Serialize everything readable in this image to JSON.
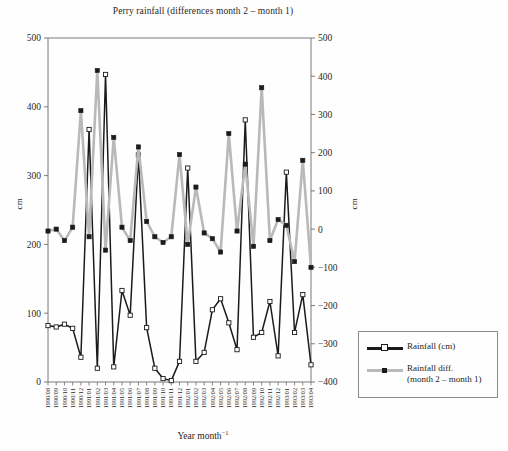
{
  "chart_data": {
    "type": "line",
    "title": "Perry rainfall (differences month 2 – month 1)",
    "xlabel_text": "Year month",
    "xlabel_sup": "−1",
    "ylabel_left": "cm",
    "ylabel_right": "cm",
    "grid": false,
    "legend_position": "right-outside",
    "ylim_left": [
      0,
      500
    ],
    "yticks_left": [
      0,
      100,
      200,
      300,
      400,
      500
    ],
    "ylim_right": [
      -400,
      500
    ],
    "yticks_right": [
      -400,
      -300,
      -200,
      -100,
      0,
      100,
      200,
      300,
      400,
      500
    ],
    "categories": [
      "1990/08",
      "1990/09",
      "1990/10",
      "1990/11",
      "1990/12",
      "1991/01",
      "1991/02",
      "1991/03",
      "1991/04",
      "1991/05",
      "1991/06",
      "1991/07",
      "1991/08",
      "1991/09",
      "1991/10",
      "1991/11",
      "1991/12",
      "1992/01",
      "1992/02",
      "1992/03",
      "1992/04",
      "1992/05",
      "1992/06",
      "1992/07",
      "1992/08",
      "1992/09",
      "1992/10",
      "1992/11",
      "1992/12",
      "1993/01",
      "1993/02",
      "1993/03",
      "1993/04"
    ],
    "series": [
      {
        "name": "Rainfall (cm)",
        "axis": "left",
        "color": "#1b1b1b",
        "marker": "open-square",
        "values": [
          82,
          80,
          84,
          78,
          36,
          367,
          20,
          447,
          22,
          133,
          97,
          330,
          79,
          20,
          5,
          2,
          30,
          311,
          30,
          43,
          105,
          121,
          86,
          47,
          381,
          65,
          72,
          117,
          38,
          305,
          72,
          127,
          25
        ]
      },
      {
        "name": "Rainfall  diff.",
        "name_line2": "(month 2 – month 1)",
        "axis": "right",
        "color": "#b9b9b9",
        "marker": "filled-square",
        "values": [
          -5,
          0,
          -30,
          5,
          310,
          -20,
          415,
          -55,
          240,
          5,
          -30,
          215,
          20,
          -20,
          -35,
          -20,
          195,
          -40,
          110,
          -10,
          -25,
          -60,
          250,
          -5,
          170,
          -45,
          370,
          -30,
          25,
          10,
          -85,
          180,
          -100
        ]
      }
    ]
  },
  "legend": {
    "items": [
      {
        "label": "Rainfall (cm)",
        "label2": ""
      },
      {
        "label": "Rainfall  diff.",
        "label2": "(month 2 – month 1)"
      }
    ]
  }
}
